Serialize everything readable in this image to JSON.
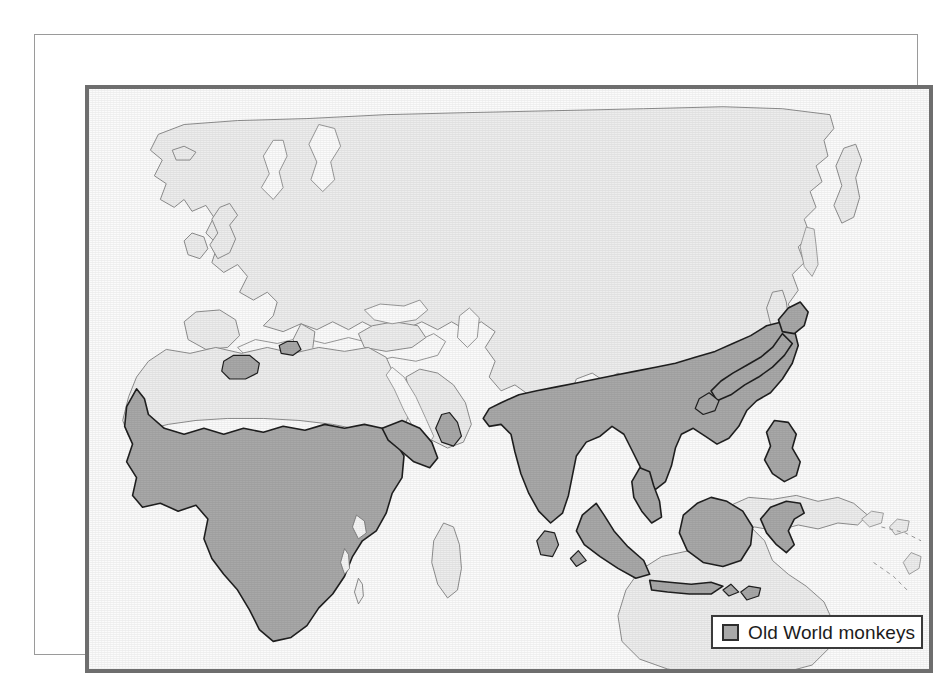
{
  "figure": {
    "kind": "distribution-map",
    "projection_note": "Old World (Africa, Europe, Asia, Australasia)",
    "background_color": "#ffffff",
    "frames": {
      "outer_border_color": "#9a9a9a",
      "inner_border_color": "#6e6e6e",
      "map_background_color": "#fbfbfb"
    }
  },
  "legend": {
    "label": "Old World monkeys",
    "swatch_fill": "#a8a8a8",
    "swatch_stroke": "#2d2d2d",
    "box_border": "#3a3a3a",
    "box_background": "#ffffff"
  },
  "map": {
    "land_fill": "#ededed",
    "land_stroke": "#8c8c8c",
    "range_fill": "#a8a8a8",
    "range_stroke": "#1f1f1f",
    "ocean_fill": "#fbfbfb",
    "shaded_regions": [
      "Sub-Saharan Africa",
      "Horn of Africa",
      "Morocco / Atlas (Barbary macaque)",
      "Gibraltar",
      "Southwest Arabia (Yemen)",
      "Indian subcontinent",
      "Sri Lanka",
      "Indochina and southern China",
      "Malay Peninsula",
      "Sumatra",
      "Java",
      "Borneo",
      "Sulawesi",
      "Philippines",
      "Lesser Sunda Islands",
      "Japan"
    ],
    "unshaded_regions": [
      "Europe",
      "North Asia / Siberia",
      "Sahara",
      "Arabian Peninsula interior",
      "Madagascar",
      "New Guinea",
      "Australia",
      "Central Asia"
    ]
  }
}
